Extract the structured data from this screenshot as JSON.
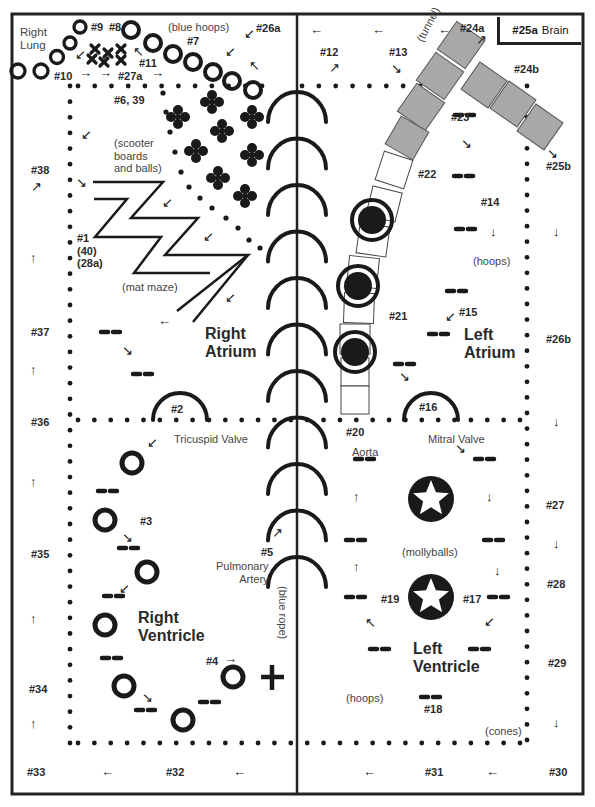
{
  "diagram": {
    "title_regions": {
      "right_lung": "Right\nLung",
      "brain_num": "#25a",
      "brain_label": "Brain",
      "right_atrium": "Right\nAtrium",
      "left_atrium": "Left\nAtrium",
      "right_ventricle": "Right\nVentricle",
      "left_ventricle": "Left\nVentricle"
    },
    "notes": {
      "blue_hoops": "(blue hoops)",
      "tunnel": "(tunnel)",
      "scooter": "(scooter\nboards\nand balls)",
      "mat_maze": "(mat maze)",
      "hoops_la": "(hoops)",
      "tricuspid": "Tricuspid Valve",
      "mitral": "Mitral Valve",
      "aorta": "Aorta",
      "mollyballs": "(mollyballs)",
      "pulmonary": "Pulmonary\nArtery",
      "blue_rope": "(blue rope)",
      "hoops_lv": "(hoops)",
      "cones": "(cones)"
    },
    "stations": [
      {
        "id": "#9",
        "x": 91,
        "y": 21
      },
      {
        "id": "#8",
        "x": 109,
        "y": 21
      },
      {
        "id": "#7",
        "x": 187,
        "y": 35
      },
      {
        "id": "#11",
        "x": 139,
        "y": 57
      },
      {
        "id": "#10",
        "x": 54,
        "y": 70
      },
      {
        "id": "#27a",
        "x": 118,
        "y": 70
      },
      {
        "id": "#26a",
        "x": 256,
        "y": 22
      },
      {
        "id": "#6, 39",
        "x": 114,
        "y": 94
      },
      {
        "id": "#38",
        "x": 31,
        "y": 164
      },
      {
        "id": "#1\n(40)\n(28a)",
        "x": 77,
        "y": 232
      },
      {
        "id": "#37",
        "x": 31,
        "y": 326
      },
      {
        "id": "#36",
        "x": 31,
        "y": 416
      },
      {
        "id": "#2",
        "x": 171,
        "y": 403
      },
      {
        "id": "#3",
        "x": 140,
        "y": 515
      },
      {
        "id": "#35",
        "x": 31,
        "y": 548
      },
      {
        "id": "#4",
        "x": 206,
        "y": 655
      },
      {
        "id": "#34",
        "x": 29,
        "y": 683
      },
      {
        "id": "#33",
        "x": 27,
        "y": 766
      },
      {
        "id": "#32",
        "x": 166,
        "y": 766
      },
      {
        "id": "#5",
        "x": 261,
        "y": 546
      },
      {
        "id": "#12",
        "x": 320,
        "y": 46
      },
      {
        "id": "#13",
        "x": 389,
        "y": 46
      },
      {
        "id": "#24a",
        "x": 460,
        "y": 22
      },
      {
        "id": "#24b",
        "x": 514,
        "y": 63
      },
      {
        "id": "#23",
        "x": 451,
        "y": 111
      },
      {
        "id": "#25b",
        "x": 546,
        "y": 160
      },
      {
        "id": "#22",
        "x": 418,
        "y": 168
      },
      {
        "id": "#14",
        "x": 481,
        "y": 196
      },
      {
        "id": "#21",
        "x": 389,
        "y": 310
      },
      {
        "id": "#15",
        "x": 459,
        "y": 306
      },
      {
        "id": "#26b",
        "x": 546,
        "y": 333
      },
      {
        "id": "#16",
        "x": 419,
        "y": 401
      },
      {
        "id": "#20",
        "x": 346,
        "y": 426
      },
      {
        "id": "#27",
        "x": 546,
        "y": 499
      },
      {
        "id": "#28",
        "x": 547,
        "y": 578
      },
      {
        "id": "#19",
        "x": 381,
        "y": 593
      },
      {
        "id": "#17",
        "x": 463,
        "y": 593
      },
      {
        "id": "#29",
        "x": 548,
        "y": 657
      },
      {
        "id": "#18",
        "x": 424,
        "y": 703
      },
      {
        "id": "#31",
        "x": 425,
        "y": 766
      },
      {
        "id": "#30",
        "x": 549,
        "y": 766
      }
    ],
    "arrows": [
      {
        "glyph": "↙",
        "x": 75,
        "y": 48
      },
      {
        "glyph": "→",
        "x": 79,
        "y": 66
      },
      {
        "glyph": "→",
        "x": 99,
        "y": 66
      },
      {
        "glyph": "→",
        "x": 151,
        "y": 66
      },
      {
        "glyph": "↖",
        "x": 133,
        "y": 45
      },
      {
        "glyph": "↙",
        "x": 244,
        "y": 27
      },
      {
        "glyph": "↙",
        "x": 225,
        "y": 45
      },
      {
        "glyph": "↖",
        "x": 249,
        "y": 59
      },
      {
        "glyph": "↙",
        "x": 81,
        "y": 128
      },
      {
        "glyph": "↗",
        "x": 31,
        "y": 180
      },
      {
        "glyph": "↘",
        "x": 76,
        "y": 176
      },
      {
        "glyph": "↙",
        "x": 162,
        "y": 196
      },
      {
        "glyph": "↙",
        "x": 203,
        "y": 230
      },
      {
        "glyph": "↑",
        "x": 30,
        "y": 251
      },
      {
        "glyph": "↙",
        "x": 225,
        "y": 291
      },
      {
        "glyph": "←",
        "x": 158,
        "y": 314
      },
      {
        "glyph": "↘",
        "x": 122,
        "y": 344
      },
      {
        "glyph": "↑",
        "x": 30,
        "y": 363
      },
      {
        "glyph": "↙",
        "x": 147,
        "y": 436
      },
      {
        "glyph": "↑",
        "x": 30,
        "y": 475
      },
      {
        "glyph": "↘",
        "x": 122,
        "y": 531
      },
      {
        "glyph": "↙",
        "x": 119,
        "y": 582
      },
      {
        "glyph": "↑",
        "x": 30,
        "y": 612
      },
      {
        "glyph": "→",
        "x": 224,
        "y": 652
      },
      {
        "glyph": "↘",
        "x": 142,
        "y": 691
      },
      {
        "glyph": "↑",
        "x": 30,
        "y": 717
      },
      {
        "glyph": "←",
        "x": 101,
        "y": 765
      },
      {
        "glyph": "←",
        "x": 233,
        "y": 765
      },
      {
        "glyph": "↗",
        "x": 272,
        "y": 526
      },
      {
        "glyph": "←",
        "x": 310,
        "y": 23
      },
      {
        "glyph": "←",
        "x": 372,
        "y": 23
      },
      {
        "glyph": "←",
        "x": 438,
        "y": 23
      },
      {
        "glyph": "↗",
        "x": 476,
        "y": 33
      },
      {
        "glyph": "↗",
        "x": 329,
        "y": 61
      },
      {
        "glyph": "↘",
        "x": 391,
        "y": 62
      },
      {
        "glyph": "↘",
        "x": 461,
        "y": 137
      },
      {
        "glyph": "↘",
        "x": 547,
        "y": 147
      },
      {
        "glyph": "↓",
        "x": 490,
        "y": 225
      },
      {
        "glyph": "↓",
        "x": 553,
        "y": 225
      },
      {
        "glyph": "↙",
        "x": 445,
        "y": 310
      },
      {
        "glyph": "↘",
        "x": 399,
        "y": 370
      },
      {
        "glyph": "↓",
        "x": 553,
        "y": 415
      },
      {
        "glyph": "↘",
        "x": 455,
        "y": 442
      },
      {
        "glyph": "↑",
        "x": 353,
        "y": 490
      },
      {
        "glyph": "↓",
        "x": 486,
        "y": 490
      },
      {
        "glyph": "↓",
        "x": 553,
        "y": 537
      },
      {
        "glyph": "↑",
        "x": 353,
        "y": 560
      },
      {
        "glyph": "↓",
        "x": 494,
        "y": 564
      },
      {
        "glyph": "↖",
        "x": 365,
        "y": 616
      },
      {
        "glyph": "↙",
        "x": 484,
        "y": 615
      },
      {
        "glyph": "↓",
        "x": 553,
        "y": 716
      },
      {
        "glyph": "←",
        "x": 363,
        "y": 765
      },
      {
        "glyph": "←",
        "x": 486,
        "y": 765
      }
    ],
    "colors": {
      "ink": "#1a1a1a",
      "tunnel_fill": "#a8a8a8",
      "border": "#222222"
    }
  }
}
